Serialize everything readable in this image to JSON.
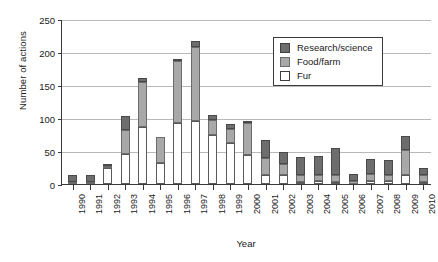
{
  "chart_data": {
    "type": "bar",
    "subtype": "stacked-vertical",
    "title": "",
    "xlabel": "Year",
    "ylabel": "Number of actions",
    "ylim": [
      0,
      250
    ],
    "yticks": [
      0,
      50,
      100,
      150,
      200,
      250
    ],
    "grid": "horizontal",
    "legend_position": "top-right-inside",
    "categories": [
      "1990",
      "1991",
      "1992",
      "1993",
      "1994",
      "1995",
      "1996",
      "1997",
      "1998",
      "1999",
      "2000",
      "2001",
      "2002",
      "2003",
      "2004",
      "2005",
      "2006",
      "2007",
      "2008",
      "2009",
      "2010"
    ],
    "series": [
      {
        "name": "Fur",
        "color": "#ffffff",
        "values": [
          0,
          0,
          25,
          45,
          86,
          32,
          93,
          95,
          75,
          62,
          44,
          13,
          13,
          3,
          5,
          3,
          0,
          4,
          4,
          13,
          3
        ]
      },
      {
        "name": "Food/farm",
        "color": "#a8a8a8",
        "values": [
          3,
          3,
          2,
          37,
          68,
          40,
          93,
          113,
          22,
          22,
          48,
          27,
          18,
          10,
          9,
          11,
          5,
          11,
          9,
          38,
          11
        ]
      },
      {
        "name": "Research/science",
        "color": "#6d6d6d",
        "values": [
          11,
          11,
          1,
          21,
          7,
          0,
          2,
          8,
          8,
          7,
          3,
          27,
          18,
          28,
          28,
          40,
          10,
          23,
          23,
          21,
          11
        ]
      }
    ],
    "totals": [
      14,
      14,
      28,
      103,
      161,
      72,
      188,
      216,
      105,
      91,
      95,
      67,
      49,
      41,
      42,
      54,
      15,
      38,
      36,
      72,
      25
    ],
    "legend_entries": [
      "Research/science",
      "Food/farm",
      "Fur"
    ]
  },
  "legend": {
    "items": [
      {
        "label": "Research/science",
        "swatch": "dark-gray-swatch"
      },
      {
        "label": "Food/farm",
        "swatch": "medium-gray-swatch"
      },
      {
        "label": "Fur",
        "swatch": "white-swatch"
      }
    ]
  },
  "axes": {
    "y_title": "Number of actions",
    "x_title": "Year",
    "y_tick_labels": [
      "0",
      "50",
      "100",
      "150",
      "200",
      "250"
    ],
    "x_tick_labels": [
      "1990",
      "1991",
      "1992",
      "1993",
      "1994",
      "1995",
      "1996",
      "1997",
      "1998",
      "1999",
      "2000",
      "2001",
      "2002",
      "2003",
      "2004",
      "2005",
      "2006",
      "2007",
      "2008",
      "2009",
      "2010"
    ]
  },
  "colors": {
    "research": "#6d6d6d",
    "food": "#a8a8a8",
    "fur": "#ffffff",
    "axis": "#3a3a3a",
    "grid": "#b9b9b9"
  }
}
